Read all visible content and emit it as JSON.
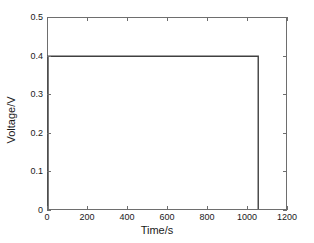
{
  "chart_data": {
    "type": "line",
    "title": "",
    "xlabel": "Time/s",
    "ylabel": "Voltage/V",
    "xlim": [
      0,
      1200
    ],
    "ylim": [
      0,
      0.5
    ],
    "xticks": [
      0,
      200,
      400,
      600,
      800,
      1000,
      1200
    ],
    "xtick_labels": [
      "0",
      "200",
      "400",
      "600",
      "800",
      "1000",
      "1200"
    ],
    "yticks": [
      0,
      0.1,
      0.2,
      0.3,
      0.4,
      0.5
    ],
    "ytick_labels": [
      "0",
      "0.1",
      "0.2",
      "0.3",
      "0.4",
      "0.5"
    ],
    "grid": false,
    "legend": null,
    "line_color": "#404040",
    "axis_color": "#6e6e6e",
    "background_color": "#ffffff",
    "series": [
      {
        "name": "Voltage",
        "x": [
          0,
          0,
          1060,
          1060
        ],
        "y": [
          0,
          0.4,
          0.4,
          0
        ]
      }
    ],
    "annotations": []
  }
}
